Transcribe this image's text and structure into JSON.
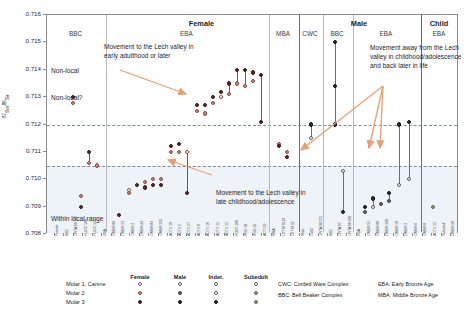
{
  "chart_data": {
    "type": "scatter",
    "title": "",
    "ylabel": "87Sr/86Sr",
    "ylim": [
      0.708,
      0.716
    ],
    "yticks": [
      "0.716",
      "0.715",
      "0.714",
      "0.713",
      "0.712",
      "0.711",
      "0.710",
      "0.709",
      "0.708"
    ],
    "grid": false,
    "reference_lines": [
      {
        "label": "non-local threshold",
        "value": 0.712
      },
      {
        "label": "local range upper",
        "value": 0.7105
      }
    ],
    "shaded_band": {
      "label": "Within local range",
      "from": 0.708,
      "to": 0.7105
    },
    "zone_labels": [
      "Non-local",
      "Non-local?",
      "Within local range"
    ],
    "groups": [
      {
        "sex": "Female",
        "periods": [
          "BBC",
          "EBA",
          "MBA"
        ]
      },
      {
        "sex": "Male",
        "periods": [
          "CWC",
          "BBC",
          "EBA"
        ]
      },
      {
        "sex": "Child",
        "periods": [
          "EBA"
        ]
      }
    ],
    "annotations": [
      {
        "id": "a1",
        "text": "Movement to the Lech valley in early adulthood or later"
      },
      {
        "id": "a2",
        "text": "Movement to the Lech valley in late childhood/adolescence"
      },
      {
        "id": "a3",
        "text": "Movement away from the Lech valley in childhood/adolescence and back later in life"
      }
    ],
    "series": [
      {
        "name": "Molar 1, Canine",
        "marker": "open circle"
      },
      {
        "name": "Molar 2",
        "marker": "light filled circle"
      },
      {
        "name": "Molar 3",
        "marker": "dark filled circle"
      }
    ],
    "categories": [
      "Female",
      "BBC",
      "UNTA 68 342",
      "HUGC 188",
      "HUGC 190",
      "EBA",
      "OMBR 80",
      "OMBR 23",
      "OMBR 2",
      "OMBR 44",
      "OMBR 83",
      "OMBR 150",
      "ACTV 18",
      "ACTV 2",
      "ACTV 27",
      "ACTV 8",
      "ACTV 16",
      "ACTV 15",
      "ACTV 12",
      "POST 186",
      "KNG 18",
      "KNG 32",
      "ACTI 33",
      "MBA",
      "OTTM 5532",
      "OTTM 32",
      "Male",
      "CWC",
      "UNTA 88 221",
      "BBC",
      "UNTA 87",
      "UNTA 88 380",
      "EBA",
      "OMBR 55",
      "OMBR 88",
      "OMBR 108",
      "OMBR 18",
      "OMBR 2",
      "OMBR 6",
      "OMBR 8",
      "ACTV 12",
      "Subadult",
      "OMBR 98"
    ],
    "samples": [
      {
        "x": 72,
        "values": [
          0.7128,
          0.713
        ],
        "markers": [
          "m2",
          "m3"
        ]
      },
      {
        "x": 80,
        "values": [
          0.7094,
          0.709
        ],
        "markers": [
          "m2",
          "m3"
        ]
      },
      {
        "x": 88,
        "values": [
          0.7106,
          0.711
        ],
        "markers": [
          "m2",
          "m3"
        ],
        "stem": true
      },
      {
        "x": 96,
        "values": [
          0.7105
        ],
        "markers": [
          "m2"
        ]
      },
      {
        "x": 118,
        "values": [
          0.7087
        ],
        "markers": [
          "m3"
        ]
      },
      {
        "x": 128,
        "values": [
          0.7096,
          0.7095
        ],
        "markers": [
          "m1",
          "m2"
        ]
      },
      {
        "x": 136,
        "values": [
          0.7098
        ],
        "markers": [
          "m3"
        ]
      },
      {
        "x": 144,
        "values": [
          0.7099,
          0.7097
        ],
        "markers": [
          "m2",
          "m3"
        ]
      },
      {
        "x": 152,
        "values": [
          0.71,
          0.7098
        ],
        "markers": [
          "m2",
          "m3"
        ]
      },
      {
        "x": 160,
        "values": [
          0.71,
          0.7098
        ],
        "markers": [
          "m2",
          "m3"
        ]
      },
      {
        "x": 170,
        "values": [
          0.7112,
          0.711
        ],
        "markers": [
          "m3",
          "m2"
        ]
      },
      {
        "x": 178,
        "values": [
          0.7113,
          0.711
        ],
        "markers": [
          "m3",
          "m2"
        ]
      },
      {
        "x": 186,
        "values": [
          0.711,
          0.7095
        ],
        "markers": [
          "m1",
          "m3"
        ],
        "stem": true
      },
      {
        "x": 196,
        "values": [
          0.7127,
          0.7125
        ],
        "markers": [
          "m3",
          "m2"
        ]
      },
      {
        "x": 204,
        "values": [
          0.7127,
          0.7124
        ],
        "markers": [
          "m3",
          "m2"
        ]
      },
      {
        "x": 212,
        "values": [
          0.713,
          0.7128
        ],
        "markers": [
          "m3",
          "m2"
        ]
      },
      {
        "x": 220,
        "values": [
          0.7132,
          0.713
        ],
        "markers": [
          "m3",
          "m1"
        ]
      },
      {
        "x": 228,
        "values": [
          0.7135,
          0.7131
        ],
        "markers": [
          "m3",
          "m2"
        ],
        "stem": true
      },
      {
        "x": 236,
        "values": [
          0.714,
          0.7135
        ],
        "markers": [
          "m3",
          "m2"
        ],
        "stem": true
      },
      {
        "x": 244,
        "values": [
          0.714,
          0.7134
        ],
        "markers": [
          "m3",
          "m2"
        ],
        "stem": true
      },
      {
        "x": 252,
        "values": [
          0.7139,
          0.7136
        ],
        "markers": [
          "m3",
          "m2"
        ]
      },
      {
        "x": 260,
        "values": [
          0.7138,
          0.7121
        ],
        "markers": [
          "m3",
          "m3"
        ],
        "stem": true
      },
      {
        "x": 278,
        "values": [
          0.7113,
          0.7112
        ],
        "markers": [
          "m2",
          "m3"
        ]
      },
      {
        "x": 286,
        "values": [
          0.711,
          0.7108
        ],
        "markers": [
          "m2",
          "m3"
        ]
      },
      {
        "x": 310,
        "values": [
          0.7115,
          0.712
        ],
        "markers": [
          "m1",
          "m3"
        ],
        "stem": true
      },
      {
        "x": 334,
        "values": [
          0.715,
          0.7134,
          0.712
        ],
        "markers": [
          "m3",
          "m3",
          "m3"
        ],
        "stem": true
      },
      {
        "x": 342,
        "values": [
          0.7103,
          0.7088
        ],
        "markers": [
          "m1",
          "m3"
        ],
        "stem": true
      },
      {
        "x": 364,
        "values": [
          0.709,
          0.7088
        ],
        "markers": [
          "m3",
          "m2"
        ]
      },
      {
        "x": 372,
        "values": [
          0.7093,
          0.709
        ],
        "markers": [
          "m3",
          "m1"
        ],
        "stem": true
      },
      {
        "x": 380,
        "values": [
          0.7091
        ],
        "markers": [
          "m2"
        ]
      },
      {
        "x": 388,
        "values": [
          0.7095,
          0.7092
        ],
        "markers": [
          "m3",
          "m2"
        ],
        "stem": true
      },
      {
        "x": 398,
        "values": [
          0.712,
          0.7098
        ],
        "markers": [
          "m3",
          "m1"
        ],
        "stem": true
      },
      {
        "x": 408,
        "values": [
          0.7121,
          0.71
        ],
        "markers": [
          "m3",
          "m1"
        ],
        "stem": true
      },
      {
        "x": 432,
        "values": [
          0.709
        ],
        "markers": [
          "sub"
        ]
      }
    ]
  },
  "legend": {
    "columns": [
      "Female",
      "Male",
      "Indet.",
      "Subedult"
    ],
    "rows": [
      "Molar 1, Canine",
      "Molar 2",
      "Molar 3"
    ]
  },
  "abbreviations": [
    "CWC: Corded Ware Complex",
    "BBC: Bell Beaker Complex",
    "EBA: Early Bronze Age",
    "MBA: Middle Bronze Age"
  ]
}
